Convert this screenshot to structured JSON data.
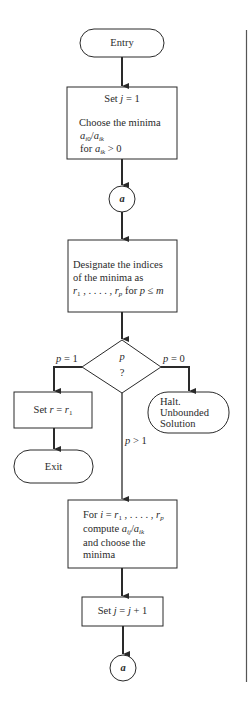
{
  "flowchart": {
    "colors": {
      "stroke": "#2a2a2a",
      "background": "#ffffff"
    },
    "entry": {
      "label": "Entry"
    },
    "box1": {
      "line1": "Set j = 1",
      "line2": "Choose the minima",
      "line3": "a_i0/a_ik",
      "line4": "for a_ik > 0"
    },
    "connector_top": {
      "label": "a"
    },
    "box2": {
      "line1": "Designate the indices",
      "line2": "of the minima as",
      "line3": "r_1, . . . , r_p for p ≤ m"
    },
    "decision": {
      "line1": "p",
      "line2": "?"
    },
    "branches": {
      "left": "p = 1",
      "right": "p = 0",
      "down": "p > 1"
    },
    "set_r": {
      "label": "Set r = r_1"
    },
    "exit": {
      "label": "Exit"
    },
    "halt": {
      "line1": "Halt.",
      "line2": "Unbounded",
      "line3": "Solution"
    },
    "box3": {
      "line1": "For i = r_1, . . . , r_p",
      "line2": "compute a_ij/a_ik",
      "line3": "and choose the",
      "line4": "minima"
    },
    "set_j": {
      "label": "Set j = j + 1"
    },
    "connector_bottom": {
      "label": "a"
    }
  }
}
